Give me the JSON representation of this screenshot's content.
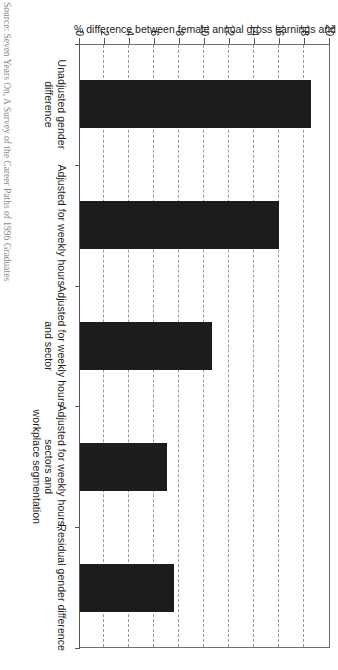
{
  "chart_data": {
    "type": "bar",
    "title": "",
    "subtitle": "",
    "orientation": "vertical-rendered-rotated",
    "categories": [
      "Unadjusted gender difference",
      "Adjusted for weekly hours",
      "Adjusted for weekly hours and sector",
      "Adjusted for weekly hours, sectors and workplace segmentation",
      "Residual gender difference"
    ],
    "category_lines": [
      [
        "Unadjusted gender difference"
      ],
      [
        "Adjusted for weekly hours"
      ],
      [
        "Adjusted for weekly hours and sector"
      ],
      [
        "Adjusted for weekly hours, sectors and",
        "workplace segmentation"
      ],
      [
        "Residual gender difference"
      ]
    ],
    "values": [
      18.5,
      15.9,
      10.6,
      7.0,
      7.5
    ],
    "xlabel": "",
    "ylabel": "% difference between female annual gross earnings and male annual gross earnings",
    "ylim": [
      0,
      20
    ],
    "ytick_values": [
      0,
      2,
      4,
      6,
      8,
      10,
      12,
      14,
      16,
      18,
      20
    ],
    "ytick_labels": [
      "0",
      "2",
      "4",
      "6",
      "8",
      "10",
      "12",
      "14",
      "16",
      "18",
      "20"
    ],
    "grid": true,
    "grid_style": "dashed",
    "legend": false,
    "legend_position": "none",
    "bar_color": "#1c1c1c",
    "gridline_color": "#9a9a9a",
    "axis_color": "#555555"
  },
  "source": {
    "label": "Source:",
    "text": "Seven Years On, A Survey of the Career Paths of 1996 Graduates",
    "full": "Source: Seven Years On, A Survey of the Career Paths of 1996 Graduates"
  }
}
